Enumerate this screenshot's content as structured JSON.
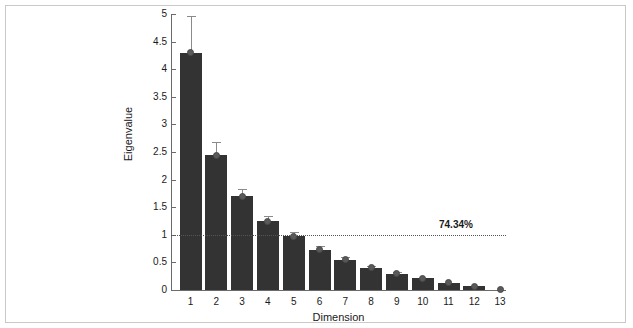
{
  "chart_data": {
    "type": "bar",
    "title": "",
    "xlabel": "Dimension",
    "ylabel": "Eigenvalue",
    "categories": [
      "1",
      "2",
      "3",
      "4",
      "5",
      "6",
      "7",
      "8",
      "9",
      "10",
      "11",
      "12",
      "13"
    ],
    "values": [
      4.3,
      2.44,
      1.7,
      1.25,
      0.97,
      0.73,
      0.55,
      0.4,
      0.29,
      0.21,
      0.13,
      0.07,
      0.01
    ],
    "errors_upper": [
      0.66,
      0.25,
      0.13,
      0.09,
      0.08,
      0.06,
      0.05,
      0.04,
      0.04,
      0.03,
      0.03,
      0.02,
      0.01
    ],
    "ylim": [
      0,
      5
    ],
    "yticks": [
      "0",
      "0.5",
      "1",
      "1.5",
      "2",
      "2.5",
      "3",
      "3.5",
      "4",
      "4.5",
      "5"
    ],
    "ytick_values": [
      0,
      0.5,
      1,
      1.5,
      2,
      2.5,
      3,
      3.5,
      4,
      4.5,
      5
    ],
    "grid": false,
    "legend": null,
    "annotations": [
      {
        "name": "variance-threshold",
        "text": "74.34%",
        "y_value": 1.0,
        "style": "dotted-horizontal-line"
      }
    ],
    "colors": {
      "bar": "#333333",
      "marker": "#5a5a5a",
      "error": "#8a8a8a",
      "axis": "#6b6b6b",
      "threshold": "#555555",
      "background": "#ffffff",
      "frame": "#c9c9c9"
    }
  }
}
